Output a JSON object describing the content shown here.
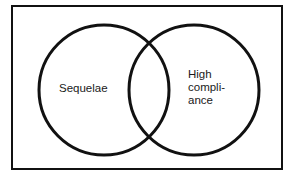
{
  "diagram": {
    "type": "venn",
    "frame": {
      "x": 12,
      "y": 6,
      "width": 270,
      "height": 163,
      "stroke": "#111111"
    },
    "sets": [
      {
        "id": "sequelae",
        "label": "Sequelae",
        "cx": 104,
        "cy": 90,
        "r": 65
      },
      {
        "id": "high-compliance",
        "label": "High\ncompli-\nance",
        "cx": 194,
        "cy": 90,
        "r": 65
      }
    ],
    "stroke_color": "#111111",
    "background": "#ffffff"
  }
}
